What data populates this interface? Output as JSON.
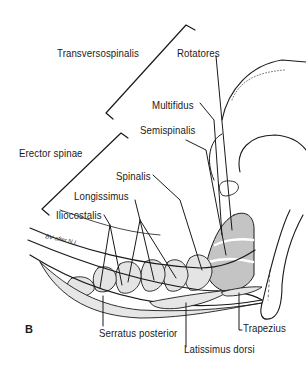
{
  "figure": {
    "panel_label": "B",
    "signature": "BV after N.I.",
    "colors": {
      "ink": "#1a1a1a",
      "muscle_shade": "#c8c8c8",
      "dark_shade": "#a9a9a9",
      "background": "#ffffff"
    }
  },
  "labels": {
    "transversospinalis": "Transversospinalis",
    "rotatores": "Rotatores",
    "multifidus": "Multifidus",
    "semispinalis": "Semispinalis",
    "erector_spinae": "Erector spinae",
    "spinalis": "Spinalis",
    "longissimus": "Longissimus",
    "iliocostalis": "Iliocostalis",
    "serratus_posterior": "Serratus posterior",
    "latissimus_dorsi": "Latissimus dorsi",
    "trapezius": "Trapezius"
  },
  "groups": [
    {
      "name": "Transversospinalis",
      "members": [
        "Rotatores",
        "Multifidus",
        "Semispinalis"
      ]
    },
    {
      "name": "Erector spinae",
      "members": [
        "Spinalis",
        "Longissimus",
        "Iliocostalis"
      ]
    }
  ],
  "superficial_muscles": [
    "Serratus posterior",
    "Latissimus dorsi",
    "Trapezius"
  ]
}
